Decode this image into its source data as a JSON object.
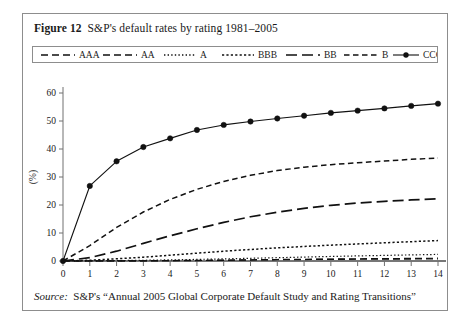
{
  "figure": {
    "label": "Figure 12",
    "title": "S&P's default rates by rating 1981–2005",
    "source_label": "Source:",
    "source_text": "S&P's “Annual 2005 Global Corporate Default Study and Rating Transitions”"
  },
  "chart_data": {
    "type": "line",
    "title": "S&P's default rates by rating 1981–2005",
    "xlabel": "(Time Horizon, years)",
    "ylabel": "(%)",
    "xlim": [
      0,
      14
    ],
    "ylim": [
      0,
      60
    ],
    "xticks": [
      0,
      1,
      2,
      3,
      4,
      5,
      6,
      7,
      8,
      9,
      10,
      11,
      12,
      13,
      14
    ],
    "yticks": [
      0,
      10,
      20,
      30,
      40,
      50,
      60
    ],
    "grid": false,
    "legend_position": "top",
    "x": [
      0,
      1,
      2,
      3,
      4,
      5,
      6,
      7,
      8,
      9,
      10,
      11,
      12,
      13,
      14
    ],
    "series": [
      {
        "name": "AAA",
        "style": "longdash",
        "dasharray": "7,4",
        "width": 1.2,
        "marker": false,
        "values": [
          0,
          0,
          0,
          0.05,
          0.1,
          0.16,
          0.23,
          0.33,
          0.46,
          0.52,
          0.58,
          0.62,
          0.66,
          0.7,
          0.75
        ]
      },
      {
        "name": "AA",
        "style": "longdash",
        "dasharray": "7,4",
        "width": 1.2,
        "marker": false,
        "values": [
          0,
          0.01,
          0.03,
          0.08,
          0.16,
          0.24,
          0.34,
          0.44,
          0.54,
          0.63,
          0.71,
          0.79,
          0.86,
          0.93,
          1.0
        ]
      },
      {
        "name": "A",
        "style": "dotted",
        "dasharray": "1.4,2.2",
        "width": 1.2,
        "marker": false,
        "values": [
          0,
          0.05,
          0.14,
          0.26,
          0.4,
          0.57,
          0.76,
          0.97,
          1.18,
          1.4,
          1.62,
          1.82,
          2.0,
          2.18,
          2.35
        ]
      },
      {
        "name": "BBB",
        "style": "densedot",
        "dasharray": "2.2,2.2",
        "width": 1.5,
        "marker": false,
        "values": [
          0,
          0.27,
          0.78,
          1.36,
          2.07,
          2.79,
          3.5,
          4.12,
          4.68,
          5.2,
          5.66,
          6.1,
          6.5,
          6.9,
          7.3
        ]
      },
      {
        "name": "BB",
        "style": "dashdot",
        "dasharray": "11,5",
        "width": 1.7,
        "marker": false,
        "values": [
          0,
          1.2,
          3.5,
          6.3,
          9.0,
          11.5,
          13.8,
          15.8,
          17.4,
          18.8,
          19.9,
          20.7,
          21.3,
          21.8,
          22.2
        ]
      },
      {
        "name": "B",
        "style": "dash",
        "dasharray": "5.5,3.5",
        "width": 1.5,
        "marker": false,
        "values": [
          0,
          5.5,
          12.0,
          17.5,
          22.0,
          25.6,
          28.4,
          30.6,
          32.3,
          33.5,
          34.4,
          35.1,
          35.7,
          36.3,
          36.8
        ]
      },
      {
        "name": "CCC/c",
        "style": "solid",
        "dasharray": "",
        "width": 1.1,
        "marker": true,
        "values": [
          0,
          26.8,
          35.6,
          40.7,
          43.8,
          46.8,
          48.6,
          49.8,
          50.9,
          51.9,
          52.9,
          53.7,
          54.5,
          55.4,
          56.2
        ]
      }
    ]
  },
  "legend": [
    {
      "label": "AAA",
      "style": "longdash",
      "dasharray": "7,4",
      "marker": false
    },
    {
      "label": "AA",
      "style": "longdash",
      "dasharray": "7,4",
      "marker": false
    },
    {
      "label": "A",
      "style": "dotted",
      "dasharray": "1.4,2.2",
      "marker": false
    },
    {
      "label": "BBB",
      "style": "densedot",
      "dasharray": "2.2,2.2",
      "marker": false
    },
    {
      "label": "BB",
      "style": "dashdot",
      "dasharray": "11,5",
      "marker": false
    },
    {
      "label": "B",
      "style": "dash",
      "dasharray": "5.5,3.5",
      "marker": false
    },
    {
      "label": "CCC/c",
      "style": "solid",
      "dasharray": "",
      "marker": true
    }
  ],
  "colors": {
    "ink": "#111111",
    "frame": "#8d8d8d",
    "axis": "#707070",
    "background": "#ffffff"
  }
}
